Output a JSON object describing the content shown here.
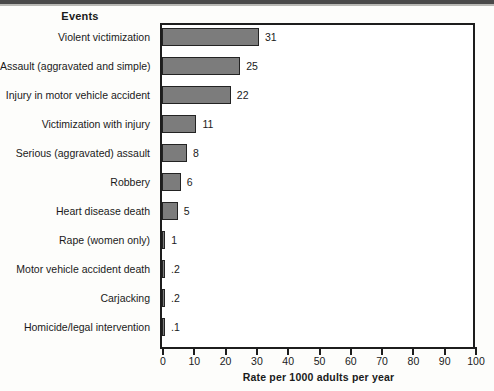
{
  "chart_data": {
    "type": "bar",
    "orientation": "horizontal",
    "title": "",
    "category_header": "Events",
    "xlabel": "Rate per 1000 adults per year",
    "ylabel": "",
    "xlim": [
      0,
      100
    ],
    "xticks": [
      0,
      10,
      20,
      30,
      40,
      50,
      60,
      70,
      80,
      90,
      100
    ],
    "xtick_labels": [
      "0",
      "10",
      "20",
      "30",
      "40",
      "50",
      "60",
      "70",
      "80",
      "90",
      "100"
    ],
    "grid": false,
    "legend": null,
    "bar_color": "#7c7c7c",
    "bar_edge_color": "#232323",
    "categories": [
      "Violent victimization",
      "Assault (aggravated and simple)",
      "Injury in motor vehicle accident",
      "Victimization with injury",
      "Serious (aggravated) assault",
      "Robbery",
      "Heart disease death",
      "Rape (women only)",
      "Motor vehicle accident death",
      "Carjacking",
      "Homicide/legal intervention"
    ],
    "values": [
      31,
      25,
      22,
      11,
      8,
      6,
      5,
      1,
      0.2,
      0.2,
      0.1
    ],
    "value_labels": [
      "31",
      "25",
      "22",
      "11",
      "8",
      "6",
      "5",
      "1",
      ".2",
      ".2",
      ".1"
    ],
    "bars": [
      {
        "label": "Violent victimization",
        "value": 31,
        "value_label": "31"
      },
      {
        "label": "Assault (aggravated and simple)",
        "value": 25,
        "value_label": "25"
      },
      {
        "label": "Injury in motor vehicle accident",
        "value": 22,
        "value_label": "22"
      },
      {
        "label": "Victimization with injury",
        "value": 11,
        "value_label": "11"
      },
      {
        "label": "Serious (aggravated) assault",
        "value": 8,
        "value_label": "8"
      },
      {
        "label": "Robbery",
        "value": 6,
        "value_label": "6"
      },
      {
        "label": "Heart disease death",
        "value": 5,
        "value_label": "5"
      },
      {
        "label": "Rape (women only)",
        "value": 1,
        "value_label": "1"
      },
      {
        "label": "Motor vehicle accident death",
        "value": 0.2,
        "value_label": ".2"
      },
      {
        "label": "Carjacking",
        "value": 0.2,
        "value_label": ".2"
      },
      {
        "label": "Homicide/legal intervention",
        "value": 0.1,
        "value_label": ".1"
      }
    ]
  }
}
